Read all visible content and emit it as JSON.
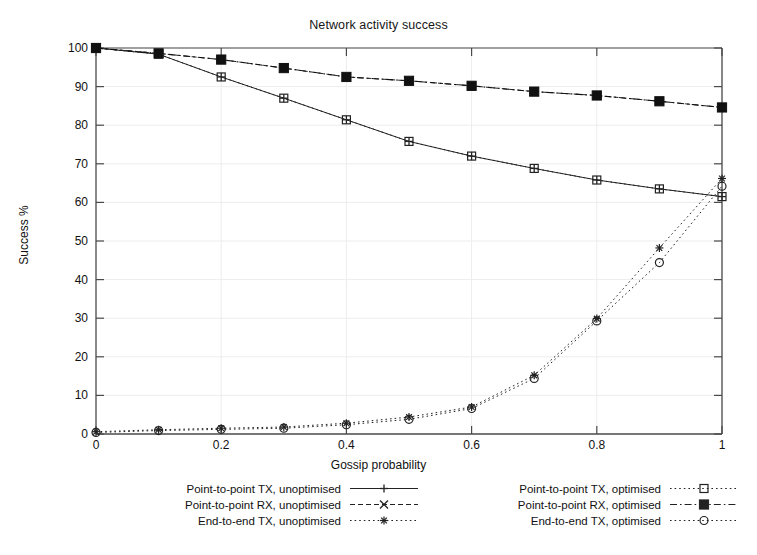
{
  "chart_data": {
    "type": "line",
    "title": "Network activity success",
    "xlabel": "Gossip probability",
    "ylabel": "Success %",
    "xlim": [
      0,
      1
    ],
    "ylim": [
      0,
      100
    ],
    "xticks": [
      "0",
      "0.2",
      "0.4",
      "0.6",
      "0.8",
      "1"
    ],
    "xtick_values": [
      0,
      0.2,
      0.4,
      0.6,
      0.8,
      1
    ],
    "yticks": [
      "0",
      "10",
      "20",
      "30",
      "40",
      "50",
      "60",
      "70",
      "80",
      "90",
      "100"
    ],
    "ytick_values": [
      0,
      10,
      20,
      30,
      40,
      50,
      60,
      70,
      80,
      90,
      100
    ],
    "grid": true,
    "legend_position": "bottom",
    "x": [
      0,
      0.1,
      0.2,
      0.3,
      0.4,
      0.5,
      0.6,
      0.7,
      0.8,
      0.9,
      1
    ],
    "series": [
      {
        "name": "Point-to-point TX, unoptimised",
        "marker": "plus",
        "dash": "solid",
        "color": "#222222",
        "values": [
          100,
          98.4,
          92.5,
          87.0,
          81.4,
          75.8,
          72.0,
          68.8,
          65.8,
          63.5,
          61.5
        ]
      },
      {
        "name": "Point-to-point RX, unoptimised",
        "marker": "cross",
        "dash": "dashed",
        "color": "#222222",
        "values": [
          100,
          98.6,
          97.0,
          94.8,
          92.5,
          91.5,
          90.2,
          88.7,
          87.7,
          86.2,
          84.6
        ]
      },
      {
        "name": "End-to-end TX, unoptimised",
        "marker": "star",
        "dash": "dotted",
        "color": "#222222",
        "values": [
          0.6,
          1.1,
          1.5,
          1.8,
          2.8,
          4.4,
          7.0,
          15.2,
          29.9,
          48.2,
          66.2
        ]
      },
      {
        "name": "Point-to-point TX, optimised",
        "marker": "square-open",
        "dash": "dotted",
        "color": "#222222",
        "values": [
          100,
          98.4,
          92.5,
          87.0,
          81.4,
          75.8,
          72.0,
          68.8,
          65.8,
          63.5,
          61.5
        ]
      },
      {
        "name": "Point-to-point RX, optimised",
        "marker": "square-filled",
        "dash": "dashdot",
        "color": "#111111",
        "values": [
          100,
          98.6,
          97.0,
          94.8,
          92.5,
          91.5,
          90.2,
          88.7,
          87.7,
          86.2,
          84.6
        ]
      },
      {
        "name": "End-to-end TX, optimised",
        "marker": "circle-open",
        "dash": "dotted",
        "color": "#222222",
        "values": [
          0.4,
          0.9,
          1.2,
          1.5,
          2.4,
          3.8,
          6.6,
          14.4,
          29.3,
          44.4,
          64.2
        ]
      }
    ]
  },
  "legend": {
    "left": [
      {
        "label": "Point-to-point TX, unoptimised",
        "marker": "plus",
        "dash": "solid"
      },
      {
        "label": "Point-to-point RX, unoptimised",
        "marker": "cross",
        "dash": "dashed"
      },
      {
        "label": "End-to-end TX, unoptimised",
        "marker": "star",
        "dash": "dotted"
      }
    ],
    "right": [
      {
        "label": "Point-to-point TX, optimised",
        "marker": "square-open",
        "dash": "dotted"
      },
      {
        "label": "Point-to-point RX, optimised",
        "marker": "square-filled",
        "dash": "dashdot"
      },
      {
        "label": "End-to-end TX, optimised",
        "marker": "circle-open",
        "dash": "dotted"
      }
    ]
  },
  "colors": {
    "axis": "#4a4a4a",
    "grid": "#ededed",
    "text": "#111111",
    "background": "#ffffff"
  }
}
